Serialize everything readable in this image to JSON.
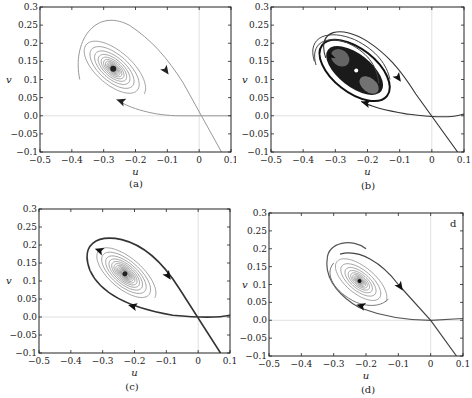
{
  "figure": {
    "panels": [
      {
        "id": "a",
        "caption": "(a)",
        "xlabel": "u",
        "ylabel": "v",
        "corner_label": ""
      },
      {
        "id": "b",
        "caption": "(b)",
        "xlabel": "u",
        "ylabel": "v",
        "corner_label": ""
      },
      {
        "id": "c",
        "caption": "(c)",
        "xlabel": "u",
        "ylabel": "v",
        "corner_label": ""
      },
      {
        "id": "d",
        "caption": "(d)",
        "xlabel": "u",
        "ylabel": "v",
        "corner_label": "d"
      }
    ]
  },
  "chart_data": [
    {
      "type": "line",
      "title": "(a)",
      "xlabel": "u",
      "ylabel": "v",
      "xlim": [
        -0.5,
        0.1
      ],
      "ylim": [
        -0.1,
        0.3
      ],
      "xticks": [
        "-0.5",
        "-0.4",
        "-0.3",
        "-0.2",
        "-0.1",
        "0",
        "0.1"
      ],
      "yticks": [
        "-0.1",
        "-0.05",
        "0.0",
        "0.05",
        "0.1",
        "0.15",
        "0.2",
        "0.25",
        "0.3"
      ],
      "annotations": {
        "equilibrium": [
          -0.27,
          0.13
        ],
        "type": "stable focus (spiral sink)"
      },
      "series": [
        {
          "name": "spiral trajectory",
          "color": "#8a8a8a"
        },
        {
          "name": "stable manifold (incoming from lower right)",
          "color": "#9a9a9a"
        },
        {
          "name": "unstable manifold along v=0",
          "color": "#9a9a9a"
        }
      ]
    },
    {
      "type": "line",
      "title": "(b)",
      "xlabel": "u",
      "ylabel": "v",
      "xlim": [
        -0.5,
        0.1
      ],
      "ylim": [
        -0.1,
        0.3
      ],
      "xticks": [
        "-0.5",
        "-0.4",
        "-0.3",
        "-0.2",
        "-0.1",
        "0",
        "0.1"
      ],
      "yticks": [
        "-0.1",
        "-0.05",
        "0.0",
        "0.05",
        "0.1",
        "0.15",
        "0.2",
        "0.25",
        "0.3"
      ],
      "annotations": {
        "equilibrium": [
          -0.24,
          0.12
        ],
        "type": "limit cycle around dense filled region"
      },
      "series": [
        {
          "name": "limit cycle (bold)",
          "color": "#222222"
        },
        {
          "name": "outer trajectories",
          "color": "#555555"
        },
        {
          "name": "stable manifold",
          "color": "#444444"
        }
      ]
    },
    {
      "type": "line",
      "title": "(c)",
      "xlabel": "u",
      "ylabel": "v",
      "xlim": [
        -0.5,
        0.1
      ],
      "ylim": [
        -0.1,
        0.3
      ],
      "xticks": [
        "-0.5",
        "-0.4",
        "-0.3",
        "-0.2",
        "-0.1",
        "0",
        "0.1"
      ],
      "yticks": [
        "-0.1",
        "-0.05",
        "0.0",
        "0.05",
        "0.1",
        "0.15",
        "0.2",
        "0.25",
        "0.3"
      ],
      "annotations": {
        "equilibrium": [
          -0.23,
          0.12
        ],
        "type": "homoclinic loop enclosing spiral"
      },
      "series": [
        {
          "name": "homoclinic orbit (bold)",
          "color": "#333333"
        },
        {
          "name": "inner spiral",
          "color": "#8a8a8a"
        }
      ]
    },
    {
      "type": "line",
      "title": "(d)",
      "xlabel": "u",
      "ylabel": "v",
      "xlim": [
        -0.5,
        0.1
      ],
      "ylim": [
        -0.1,
        0.3
      ],
      "xticks": [
        "-0.5",
        "-0.4",
        "-0.3",
        "-0.2",
        "-0.1",
        "0",
        "0.1"
      ],
      "yticks": [
        "-0.1",
        "-0.05",
        "0.0",
        "0.05",
        "0.1",
        "0.15",
        "0.2",
        "0.25",
        "0.3"
      ],
      "annotations": {
        "equilibrium": [
          -0.22,
          0.11
        ],
        "type": "stable focus",
        "corner_label": "d"
      },
      "series": [
        {
          "name": "outer trajectory",
          "color": "#555555"
        },
        {
          "name": "inner spiral",
          "color": "#8a8a8a"
        },
        {
          "name": "stable manifold",
          "color": "#444444"
        }
      ]
    }
  ]
}
